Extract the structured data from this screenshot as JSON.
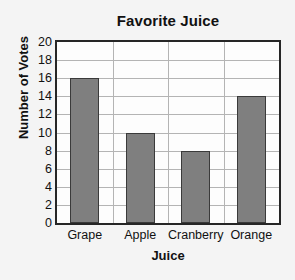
{
  "chart_data": {
    "type": "bar",
    "title": "Favorite Juice",
    "xlabel": "Juice",
    "ylabel": "Number of Votes",
    "categories": [
      "Grape",
      "Apple",
      "Cranberry",
      "Orange"
    ],
    "values": [
      16,
      10,
      8,
      14
    ],
    "ylim": [
      0,
      20
    ],
    "ytick_step": 2,
    "yticks": [
      0,
      2,
      4,
      6,
      8,
      10,
      12,
      14,
      16,
      18,
      20
    ],
    "ytick_labels": [
      "0",
      "2",
      "4",
      "6",
      "8",
      "10",
      "12",
      "14",
      "16",
      "18",
      "20"
    ],
    "grid": "horizontal-and-vertical",
    "legend": "none",
    "colors": {
      "bar_fill": "#7f7f7f",
      "bar_stroke": "#3a3a3a",
      "plot_background": "#fdfdfd",
      "page_background": "#f4f4f4",
      "frame": "#262626",
      "gridline": "#b4b4b4",
      "text": "#111111"
    }
  }
}
